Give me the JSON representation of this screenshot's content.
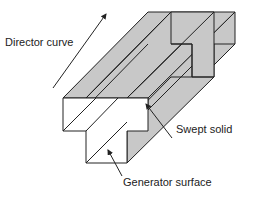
{
  "labels": {
    "director": "Director curve",
    "swept": "Swept solid",
    "generator": "Generator surface"
  },
  "colors": {
    "shaded": "#c8c8c8",
    "line": "#222222",
    "front": "#ffffff"
  }
}
